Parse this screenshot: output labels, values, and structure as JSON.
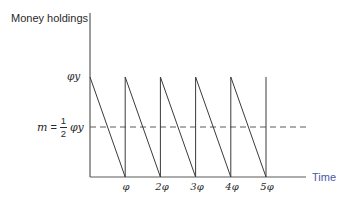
{
  "chart_data": {
    "type": "line",
    "title": "",
    "xlabel": "Time",
    "ylabel": "Money holdings",
    "x_ticks": [
      "φ",
      "2φ",
      "3φ",
      "4φ",
      "5φ"
    ],
    "y_ticks": [
      "φy"
    ],
    "annotation": {
      "label": "m = ½ φy",
      "value": 0.5,
      "style": "dashed",
      "description": "average money holdings"
    },
    "series": [
      {
        "name": "Money holdings (sawtooth)",
        "x": [
          0,
          1,
          1,
          2,
          2,
          3,
          3,
          4,
          4,
          5,
          5
        ],
        "y": [
          1,
          0,
          1,
          0,
          1,
          0,
          1,
          0,
          1,
          0,
          1
        ],
        "x_unit": "φ",
        "y_unit": "φy"
      }
    ],
    "xlim": [
      0,
      5.3
    ],
    "ylim": [
      0,
      1.45
    ],
    "grid": false,
    "legend": false
  },
  "labels": {
    "ylabel": "Money holdings",
    "xlabel": "Time",
    "phiy": "φy",
    "m": "m",
    "eq": "=",
    "num": "1",
    "den": "2",
    "phiy2": "φy",
    "ticks": [
      "φ",
      "2φ",
      "3φ",
      "4φ",
      "5φ"
    ]
  },
  "colors": {
    "axis": "#555555",
    "line": "#3a3a3a",
    "time_label": "#4a58a8"
  }
}
